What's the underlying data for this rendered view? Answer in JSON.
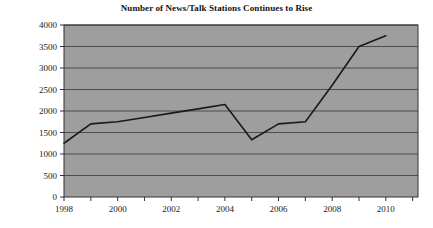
{
  "chart_data": {
    "type": "line",
    "title": "Number of News/Talk Stations Continues to Rise",
    "xlabel": "",
    "ylabel": "",
    "x": [
      1998,
      1999,
      2000,
      2001,
      2002,
      2003,
      2004,
      2005,
      2006,
      2007,
      2008,
      2009,
      2010
    ],
    "values": [
      1250,
      1700,
      1750,
      1850,
      1950,
      2050,
      2150,
      1330,
      1700,
      1750,
      2600,
      3500,
      3750
    ],
    "series": [
      {
        "name": "News/Talk Stations",
        "values": [
          1250,
          1700,
          1750,
          1850,
          1950,
          2050,
          2150,
          1330,
          1700,
          1750,
          2600,
          3500,
          3750
        ]
      }
    ],
    "xlim": [
      1998,
      2011.2
    ],
    "ylim": [
      0,
      4000
    ],
    "ytick_labels": [
      "0",
      "500",
      "1000",
      "1500",
      "2000",
      "2500",
      "3000",
      "3500",
      "4000"
    ],
    "ytick_values": [
      0,
      500,
      1000,
      1500,
      2000,
      2500,
      3000,
      3500,
      4000
    ],
    "xtick_labels": [
      "1998",
      "2000",
      "2002",
      "2004",
      "2006",
      "2008",
      "2010"
    ],
    "xtick_values": [
      1998,
      2000,
      2002,
      2004,
      2006,
      2008,
      2010
    ],
    "grid": "horizontal",
    "legend": "none",
    "colors": {
      "plot_background": "#9e9e9e",
      "grid_line": "#4d4d4d",
      "series_line": "#1a1a1a",
      "axis_line": "#333333",
      "page_background": "#ffffff",
      "title_text": "#111111",
      "tick_text": "#1a1a1a"
    }
  }
}
